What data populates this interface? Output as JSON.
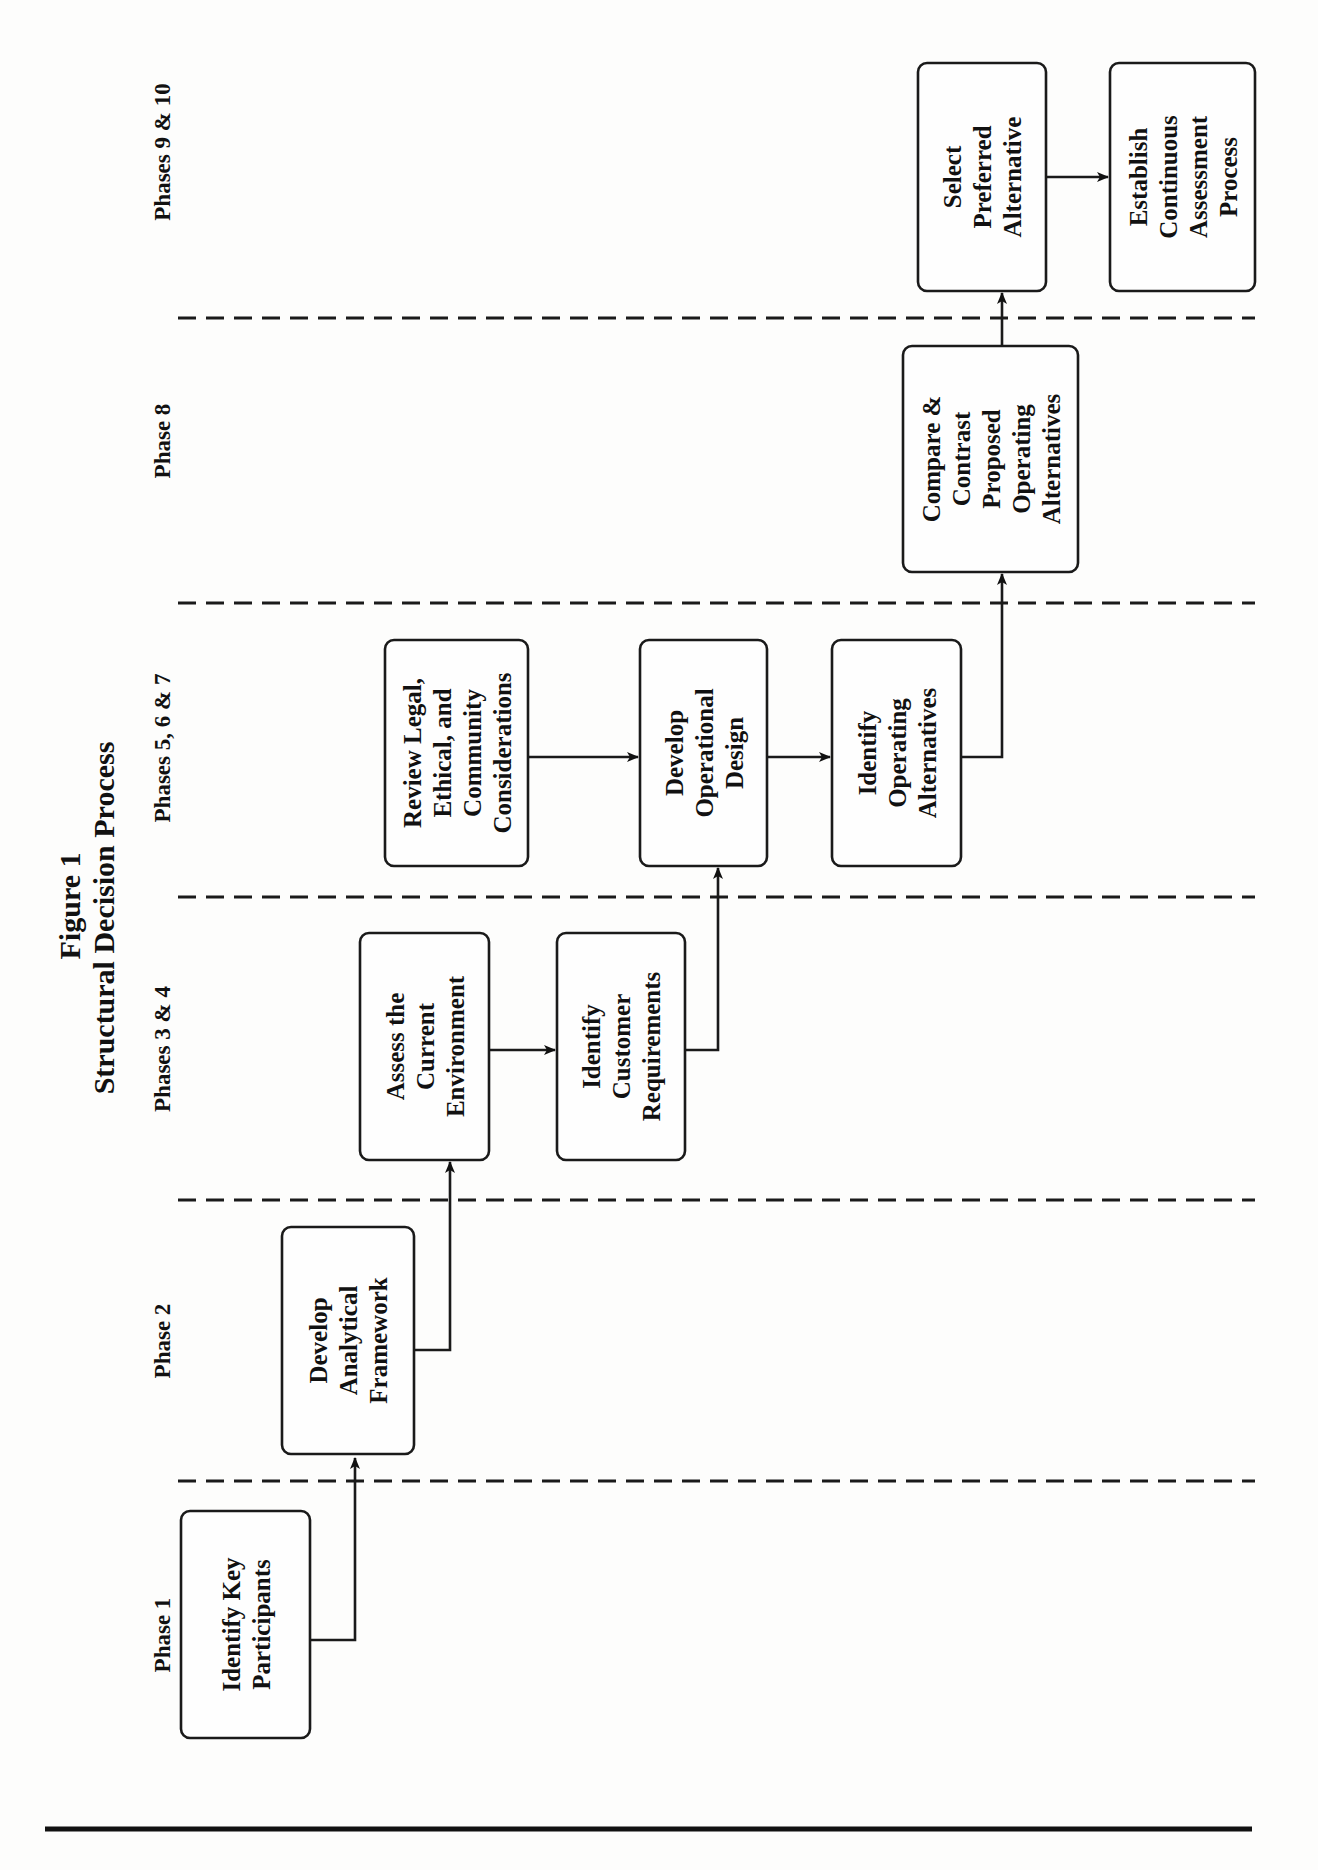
{
  "figure": {
    "label": "Figure 1",
    "title": "Structural Decision Process"
  },
  "phases": [
    {
      "id": "p1",
      "label": "Phase 1"
    },
    {
      "id": "p2",
      "label": "Phase 2"
    },
    {
      "id": "p34",
      "label": "Phases 3 & 4"
    },
    {
      "id": "p567",
      "label": "Phases 5, 6 & 7"
    },
    {
      "id": "p8",
      "label": "Phase 8"
    },
    {
      "id": "p910",
      "label": "Phases 9 & 10"
    }
  ],
  "steps": [
    {
      "id": "identify-key-participants",
      "lines": [
        "Identify Key",
        "Participants"
      ]
    },
    {
      "id": "develop-analytical-framework",
      "lines": [
        "Develop",
        "Analytical",
        "Framework"
      ]
    },
    {
      "id": "assess-current-environment",
      "lines": [
        "Assess the",
        "Current",
        "Environment"
      ]
    },
    {
      "id": "identify-customer-requirements",
      "lines": [
        "Identify",
        "Customer",
        "Requirements"
      ]
    },
    {
      "id": "review-legal-ethical-community",
      "lines": [
        "Review Legal,",
        "Ethical, and",
        "Community",
        "Considerations"
      ]
    },
    {
      "id": "develop-operational-design",
      "lines": [
        "Develop",
        "Operational",
        "Design"
      ]
    },
    {
      "id": "identify-operating-alternatives",
      "lines": [
        "Identify",
        "Operating",
        "Alternatives"
      ]
    },
    {
      "id": "compare-contrast-alternatives",
      "lines": [
        "Compare &",
        "Contrast",
        "Proposed",
        "Operating",
        "Alternatives"
      ]
    },
    {
      "id": "select-preferred-alternative",
      "lines": [
        "Select",
        "Preferred",
        "Alternative"
      ]
    },
    {
      "id": "establish-continuous-assessment",
      "lines": [
        "Establish",
        "Continuous",
        "Assessment",
        "Process"
      ]
    }
  ],
  "flows": [
    {
      "from": "identify-key-participants",
      "to": "develop-analytical-framework"
    },
    {
      "from": "develop-analytical-framework",
      "to": "assess-current-environment"
    },
    {
      "from": "assess-current-environment",
      "to": "identify-customer-requirements"
    },
    {
      "from": "identify-customer-requirements",
      "to": "develop-operational-design"
    },
    {
      "from": "review-legal-ethical-community",
      "to": "develop-operational-design"
    },
    {
      "from": "develop-operational-design",
      "to": "identify-operating-alternatives"
    },
    {
      "from": "identify-operating-alternatives",
      "to": "compare-contrast-alternatives"
    },
    {
      "from": "compare-contrast-alternatives",
      "to": "select-preferred-alternative"
    },
    {
      "from": "select-preferred-alternative",
      "to": "establish-continuous-assessment"
    }
  ]
}
